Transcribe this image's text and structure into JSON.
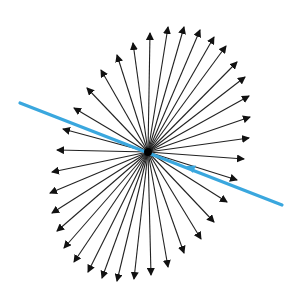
{
  "diagram": {
    "type": "radial-vector-burst",
    "background": "#ffffff",
    "center": [
      148,
      152
    ],
    "arrow_color": "#222222",
    "arrow_width": 1.1,
    "arrow_tips": [
      [
        150,
        33
      ],
      [
        168,
        27
      ],
      [
        184,
        27
      ],
      [
        200,
        30
      ],
      [
        214,
        37
      ],
      [
        226,
        46
      ],
      [
        237,
        62
      ],
      [
        245,
        77
      ],
      [
        249,
        96
      ],
      [
        250,
        117
      ],
      [
        249,
        138
      ],
      [
        244,
        159
      ],
      [
        237,
        180
      ],
      [
        227,
        202
      ],
      [
        214,
        222
      ],
      [
        201,
        239
      ],
      [
        184,
        253
      ],
      [
        168,
        267
      ],
      [
        151,
        275
      ],
      [
        134,
        279
      ],
      [
        117,
        281
      ],
      [
        102,
        278
      ],
      [
        88,
        272
      ],
      [
        74,
        262
      ],
      [
        64,
        248
      ],
      [
        57,
        231
      ],
      [
        52,
        213
      ],
      [
        50,
        193
      ],
      [
        52,
        172
      ],
      [
        57,
        150
      ],
      [
        63,
        129
      ],
      [
        74,
        108
      ],
      [
        87,
        88
      ],
      [
        101,
        70
      ],
      [
        117,
        55
      ],
      [
        133,
        43
      ]
    ],
    "line": {
      "color": "#3aa7de",
      "width": 3.2,
      "start": [
        20,
        103
      ],
      "end": [
        282,
        205
      ],
      "arrowhead_at": [
        186,
        166
      ],
      "arrowhead_direction": "up-left"
    }
  }
}
